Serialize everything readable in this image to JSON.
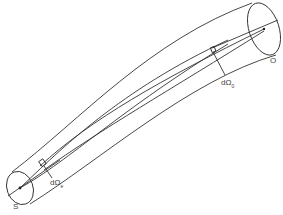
{
  "diagram": {
    "type": "ray tube between source and observer",
    "labels": {
      "source": "S",
      "observer": "O",
      "solid_angle_emit": "dΩ",
      "solid_angle_emit_sub": "e",
      "solid_angle_obs": "dΩ",
      "solid_angle_obs_sub": "0"
    }
  }
}
